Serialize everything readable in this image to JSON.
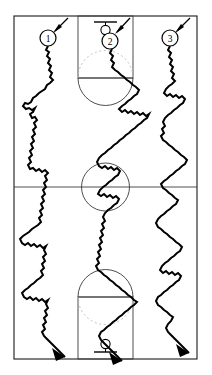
{
  "figure": {
    "background_color": "#ffffff",
    "line_color": "#1a1a1a",
    "path_color": "#000000",
    "dashed_color": "#b9b9b9",
    "width": 212,
    "height": 375
  },
  "court": {
    "name": "basketball-court",
    "outline": {
      "x": 14,
      "y": 16,
      "width": 183,
      "height": 343
    },
    "half_court_line_y": 187,
    "center_circle": {
      "cx": 105.5,
      "cy": 187,
      "r": 24
    },
    "keys": [
      {
        "id": "top-key",
        "x": 78,
        "y": 16,
        "width": 55,
        "height": 62,
        "free_throw_line_y": 78,
        "arc_style": "solid-below-dashed-above"
      },
      {
        "id": "bottom-key",
        "x": 78,
        "y": 297,
        "width": 55,
        "height": 62,
        "free_throw_line_y": 297,
        "arc_style": "solid-above-dashed-below"
      }
    ],
    "baskets": [
      {
        "id": "top-basket",
        "cx": 105.5,
        "backboard_y": 22,
        "hoop_cy": 30,
        "hoop_r": 5
      },
      {
        "id": "bottom-basket",
        "cx": 105.5,
        "backboard_y": 352,
        "hoop_cy": 344,
        "hoop_r": 5
      }
    ]
  },
  "markers": [
    {
      "id": 1,
      "label": "1",
      "cx": 48,
      "cy": 38,
      "r": 8
    },
    {
      "id": 2,
      "label": "2",
      "cx": 110,
      "cy": 41,
      "r": 8
    },
    {
      "id": 3,
      "label": "3",
      "cx": 170,
      "cy": 38,
      "r": 8
    }
  ],
  "pointers": [
    {
      "for_marker": "1",
      "from": [
        68,
        18
      ],
      "to": [
        53,
        32
      ]
    },
    {
      "for_marker": "2",
      "from": [
        130,
        18
      ],
      "to": [
        115,
        33
      ]
    },
    {
      "for_marker": "3",
      "from": [
        190,
        18
      ],
      "to": [
        175,
        32
      ]
    }
  ],
  "trajectories": [
    {
      "id": "walk-1",
      "label": "1",
      "start": [
        48,
        46
      ],
      "end": [
        54,
        370
      ],
      "description": "jagged random walk from marker 1 down the left side of the court, exiting past the bottom baseline with an arrowhead"
    },
    {
      "id": "walk-2",
      "label": "2",
      "start": [
        112,
        49
      ],
      "end": [
        118,
        370
      ],
      "description": "jagged random walk from marker 2 through the key, center circle and bottom key, exiting past the bottom baseline with an arrowhead"
    },
    {
      "id": "walk-3",
      "label": "3",
      "start": [
        170,
        46
      ],
      "end": [
        176,
        370
      ],
      "description": "jagged random walk from marker 3 down the right side of the court, exiting past the bottom baseline with an arrowhead"
    }
  ]
}
